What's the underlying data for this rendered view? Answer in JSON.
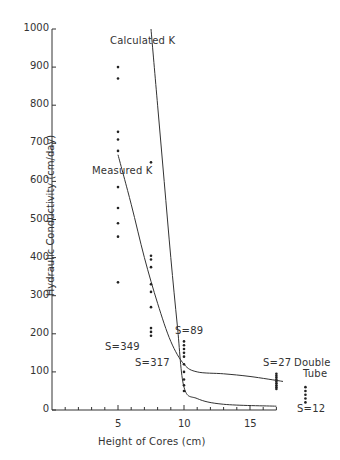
{
  "chart_data": {
    "type": "scatter",
    "title": "",
    "xlabel": "Height of Cores (cm)",
    "ylabel": "Hydraulic Conductivity (cm/day)",
    "xlim": [
      0,
      17
    ],
    "ylim": [
      0,
      1000
    ],
    "x_ticks": [
      5,
      10,
      15
    ],
    "y_ticks": [
      0,
      100,
      200,
      300,
      400,
      500,
      600,
      700,
      800,
      900,
      1000
    ],
    "grid": false,
    "legend": "none (curves labeled inline)",
    "series": [
      {
        "name": "Measured points (5 cm)",
        "label": "S=349",
        "x": 5,
        "values": [
          900,
          870,
          730,
          710,
          680,
          585,
          530,
          490,
          455,
          335
        ]
      },
      {
        "name": "Measured points (7.5 cm)",
        "label": "S=317",
        "x": 7.5,
        "values": [
          650,
          405,
          395,
          375,
          330,
          310,
          270,
          215,
          205,
          195
        ]
      },
      {
        "name": "Measured points (10 cm)",
        "label": "S=89",
        "x": 10,
        "values": [
          180,
          170,
          160,
          150,
          140,
          120,
          100,
          80,
          65,
          50
        ]
      },
      {
        "name": "Measured points (17 cm)",
        "label": "S=27",
        "x": 17,
        "values": [
          95,
          90,
          85,
          80,
          75,
          70,
          65,
          60,
          55
        ]
      },
      {
        "name": "Double Tube points",
        "label": "S=12",
        "x": 19.2,
        "values": [
          60,
          50,
          40,
          30,
          20
        ]
      }
    ],
    "curves": [
      {
        "name": "Calculated K",
        "points": [
          [
            7.5,
            1000
          ],
          [
            8.0,
            800
          ],
          [
            8.5,
            600
          ],
          [
            9.0,
            400
          ],
          [
            9.5,
            220
          ],
          [
            10.0,
            60
          ],
          [
            11,
            30
          ],
          [
            13,
            15
          ],
          [
            17,
            10
          ]
        ]
      },
      {
        "name": "Measured K",
        "points": [
          [
            5,
            670
          ],
          [
            6,
            540
          ],
          [
            7,
            400
          ],
          [
            8,
            280
          ],
          [
            9,
            180
          ],
          [
            10,
            120
          ],
          [
            11,
            100
          ],
          [
            13,
            95
          ],
          [
            15,
            88
          ],
          [
            17.5,
            75
          ]
        ]
      }
    ]
  },
  "labels": {
    "calculated_k": "Calculated K",
    "measured_k": "Measured K",
    "s349": "S=349",
    "s317": "S=317",
    "s89": "S=89",
    "s27": "S=27",
    "double_tube": "Double",
    "double_tube2": "Tube",
    "s12": "S=12"
  },
  "axis": {
    "xlabel": "Height of Cores (cm)",
    "ylabel": "Hydraulic Conductivity (cm/day)",
    "x_ticks": [
      "5",
      "10",
      "15"
    ],
    "y_ticks": [
      "0",
      "100",
      "200",
      "300",
      "400",
      "500",
      "600",
      "700",
      "800",
      "900",
      "1000"
    ]
  }
}
